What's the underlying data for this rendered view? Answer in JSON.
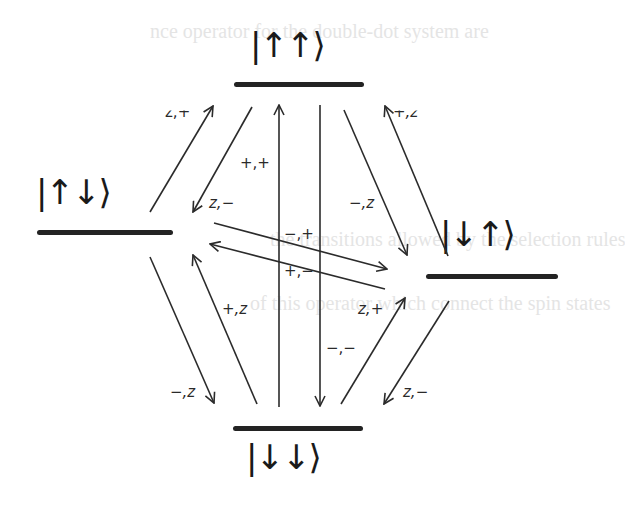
{
  "diagram": {
    "type": "energy-level transition diagram",
    "background_text": [
      "nce operator for the double-dot system are",
      "the transitions allowed by the selection rules",
      "of this operator which connect the spin states"
    ],
    "levels": [
      {
        "id": "up-up",
        "ket": "|↑↑⟩",
        "position": "top"
      },
      {
        "id": "up-down",
        "ket": "|↑↓⟩",
        "position": "left"
      },
      {
        "id": "down-up",
        "ket": "|↓↑⟩",
        "position": "right"
      },
      {
        "id": "down-down",
        "ket": "|↓↓⟩",
        "position": "bottom"
      }
    ],
    "transitions": [
      {
        "from": "up-down",
        "to": "up-up",
        "label": "z,+"
      },
      {
        "from": "up-up",
        "to": "up-down",
        "label": "z,−"
      },
      {
        "from": "down-down",
        "to": "up-up",
        "label": "+,+"
      },
      {
        "from": "up-up",
        "to": "down-up",
        "label": "−,z"
      },
      {
        "from": "down-up",
        "to": "up-up",
        "label": "+,z"
      },
      {
        "from": "up-down",
        "to": "down-up",
        "label": "−,+"
      },
      {
        "from": "down-up",
        "to": "up-down",
        "label": "+,−"
      },
      {
        "from": "up-down",
        "to": "down-down",
        "label": "−,z"
      },
      {
        "from": "down-down",
        "to": "up-down",
        "label": "+,z"
      },
      {
        "from": "up-up",
        "to": "down-down",
        "label": "−,−"
      },
      {
        "from": "down-down",
        "to": "down-up",
        "label": "z,+"
      },
      {
        "from": "down-up",
        "to": "down-down",
        "label": "z,−"
      }
    ]
  }
}
